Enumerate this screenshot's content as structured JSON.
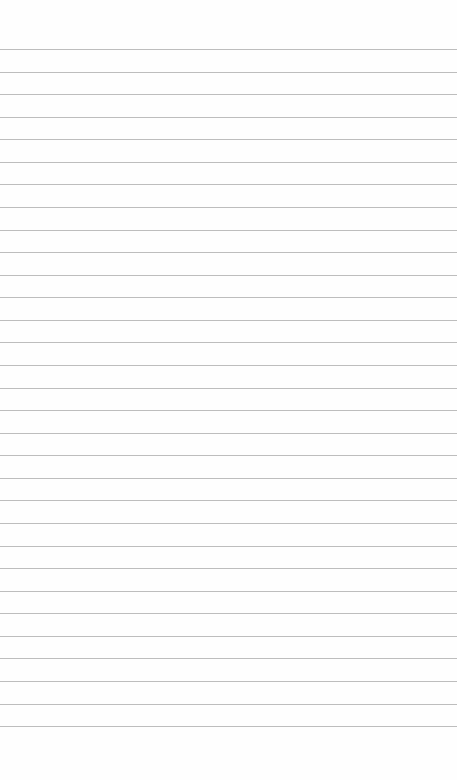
{
  "notepad": {
    "content": "",
    "line_count": 31,
    "first_line_y": 49,
    "line_spacing": 22.57,
    "line_color": "#bdbdbd",
    "background_color": "#fefefe"
  }
}
